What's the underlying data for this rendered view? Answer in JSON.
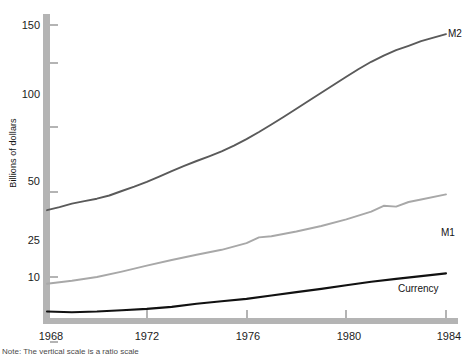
{
  "chart_data": {
    "type": "line",
    "title": "",
    "xlabel": "",
    "ylabel": "Billions of dollars",
    "yscale": "log",
    "ylim": [
      5,
      170
    ],
    "xlim": [
      1968,
      1984.4
    ],
    "grid": false,
    "legend_position": "inline-right",
    "x_ticks": [
      1968,
      1972,
      1976,
      1980,
      1984
    ],
    "x_tick_labels": [
      "1968",
      "1972",
      "1976",
      "1980",
      "1984"
    ],
    "y_ticks": [
      10,
      25,
      50,
      100,
      150
    ],
    "y_tick_labels": [
      "10",
      "25",
      "50",
      "100",
      "150"
    ],
    "y_minor_ticks": [
      5
    ],
    "series": [
      {
        "name": "M2",
        "color": "#5a5a5a",
        "label": "M2",
        "x": [
          1968.0,
          1968.5,
          1969.0,
          1969.5,
          1970.0,
          1970.5,
          1971.0,
          1971.5,
          1972.0,
          1972.5,
          1973.0,
          1973.5,
          1974.0,
          1974.5,
          1975.0,
          1975.5,
          1976.0,
          1976.5,
          1977.0,
          1977.5,
          1978.0,
          1978.5,
          1979.0,
          1979.5,
          1980.0,
          1980.5,
          1981.0,
          1981.5,
          1982.0,
          1982.5,
          1983.0,
          1983.5,
          1984.0
        ],
        "values": [
          20.5,
          21.2,
          22.0,
          22.6,
          23.2,
          24.0,
          25.2,
          26.4,
          27.8,
          29.4,
          31.2,
          33.0,
          34.8,
          36.6,
          38.6,
          41.0,
          44.0,
          47.5,
          51.5,
          56.0,
          61.0,
          66.5,
          72.5,
          79.0,
          86.0,
          93.5,
          101.0,
          108.0,
          114.5,
          120.0,
          126.0,
          131.0,
          136.0
        ]
      },
      {
        "name": "M1",
        "color": "#a8a8a8",
        "label": "M1",
        "x": [
          1968.0,
          1969.0,
          1970.0,
          1971.0,
          1972.0,
          1973.0,
          1974.0,
          1975.0,
          1976.0,
          1976.5,
          1977.0,
          1978.0,
          1979.0,
          1980.0,
          1981.0,
          1981.5,
          1982.0,
          1982.5,
          1983.0,
          1984.0
        ],
        "values": [
          9.3,
          9.6,
          10.0,
          10.6,
          11.3,
          12.0,
          12.7,
          13.4,
          14.4,
          15.3,
          15.5,
          16.3,
          17.3,
          18.6,
          20.2,
          21.5,
          21.3,
          22.4,
          23.0,
          24.3
        ]
      },
      {
        "name": "Currency",
        "color": "#111111",
        "label": "Currency",
        "x": [
          1968.0,
          1969.0,
          1970.0,
          1971.0,
          1972.0,
          1973.0,
          1974.0,
          1975.0,
          1976.0,
          1977.0,
          1978.0,
          1979.0,
          1980.0,
          1981.0,
          1982.0,
          1983.0,
          1984.0
        ],
        "values": [
          6.9,
          6.85,
          6.9,
          7.0,
          7.1,
          7.25,
          7.5,
          7.7,
          7.9,
          8.2,
          8.5,
          8.8,
          9.15,
          9.5,
          9.8,
          10.1,
          10.4
        ]
      }
    ]
  },
  "axis": {
    "y_title": "Billions of dollars",
    "axis_color": "#b4b4b4"
  },
  "footnote": {
    "text": "Note: The vertical scale is a ratio scale"
  }
}
